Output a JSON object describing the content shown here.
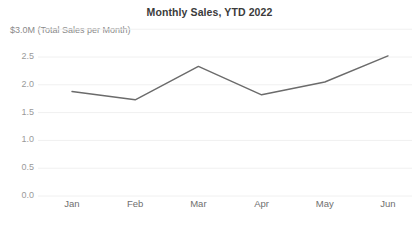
{
  "chart_data": {
    "type": "line",
    "title": "Monthly Sales, YTD 2022",
    "ylabel": "$3.0M (Total Sales per Month)",
    "xlabel": "",
    "categories": [
      "Jan",
      "Feb",
      "Mar",
      "Apr",
      "May",
      "Jun"
    ],
    "values": [
      1.88,
      1.73,
      2.33,
      1.82,
      2.05,
      2.52
    ],
    "series": [
      {
        "name": "Total Sales per Month",
        "values": [
          1.88,
          1.73,
          2.33,
          1.82,
          2.05,
          2.52
        ]
      }
    ],
    "ylim": [
      0.0,
      3.0
    ],
    "yticks": [
      "0.0",
      "0.5",
      "1.0",
      "1.5",
      "2.0",
      "2.5"
    ],
    "ytick_values": [
      0.0,
      0.5,
      1.0,
      1.5,
      2.0,
      2.5
    ],
    "grid": true,
    "grid_axis": "y",
    "legend": false,
    "line_color": "#6b6b6b",
    "grid_color": "#f0f0f0",
    "title_color": "#3b3b3b",
    "tick_color": "#9a9a9a",
    "units": "$M"
  }
}
